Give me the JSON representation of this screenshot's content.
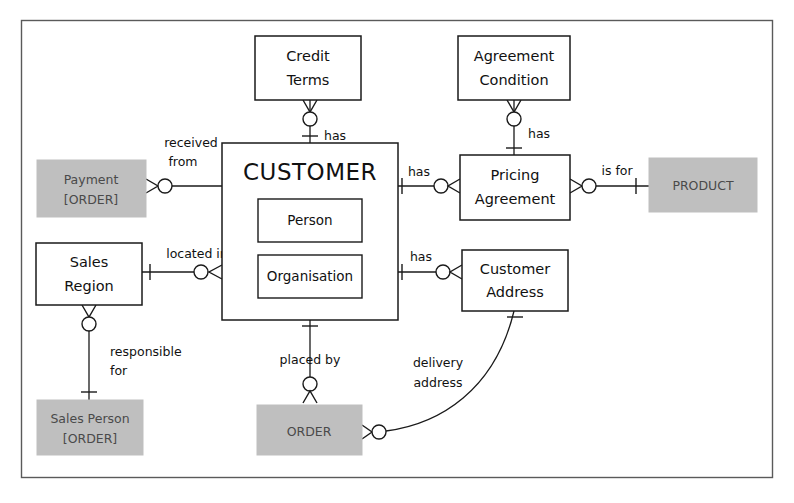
{
  "diagram": {
    "type": "entity-relationship",
    "notation": "crows-foot",
    "colors": {
      "shaded_entity_fill": "#bfbfbf",
      "plain_entity_fill": "#ffffff",
      "stroke": "#1a1a1a",
      "frame_stroke": "#5a5a5a",
      "background": "#ffffff"
    }
  },
  "entities": [
    {
      "id": "credit_terms",
      "label_lines": [
        "Credit",
        "Terms"
      ],
      "line1": "Credit",
      "line2": "Terms",
      "style": "plain",
      "x": 255,
      "y": 36,
      "w": 106,
      "h": 64
    },
    {
      "id": "agreement_condition",
      "label_lines": [
        "Agreement",
        "Condition"
      ],
      "line1": "Agreement",
      "line2": "Condition",
      "style": "plain",
      "x": 458,
      "y": 36,
      "w": 112,
      "h": 64
    },
    {
      "id": "payment_order",
      "label_lines": [
        "Payment",
        "[ORDER]"
      ],
      "line1": "Payment",
      "line2": "[ORDER]",
      "style": "shaded",
      "x": 37,
      "y": 160,
      "w": 109,
      "h": 57
    },
    {
      "id": "customer",
      "label_lines": [
        "CUSTOMER"
      ],
      "line1": "CUSTOMER",
      "style": "plain-large",
      "x": 222,
      "y": 143,
      "w": 176,
      "h": 177,
      "subtypes": [
        {
          "id": "person",
          "label": "Person",
          "x": 258,
          "y": 199,
          "w": 104,
          "h": 43
        },
        {
          "id": "organisation",
          "label": "Organisation",
          "x": 258,
          "y": 255,
          "w": 104,
          "h": 43
        }
      ]
    },
    {
      "id": "pricing_agreement",
      "label_lines": [
        "Pricing",
        "Agreement"
      ],
      "line1": "Pricing",
      "line2": "Agreement",
      "style": "plain",
      "x": 460,
      "y": 155,
      "w": 110,
      "h": 65
    },
    {
      "id": "product",
      "label_lines": [
        "PRODUCT"
      ],
      "line1": "PRODUCT",
      "style": "shaded",
      "x": 649,
      "y": 158,
      "w": 108,
      "h": 54
    },
    {
      "id": "sales_region",
      "label_lines": [
        "Sales",
        "Region"
      ],
      "line1": "Sales",
      "line2": "Region",
      "style": "plain",
      "x": 36,
      "y": 243,
      "w": 106,
      "h": 62
    },
    {
      "id": "customer_address",
      "label_lines": [
        "Customer",
        "Address"
      ],
      "line1": "Customer",
      "line2": "Address",
      "style": "plain",
      "x": 462,
      "y": 250,
      "w": 106,
      "h": 61
    },
    {
      "id": "sales_person_order",
      "label_lines": [
        "Sales Person",
        "[ORDER]"
      ],
      "line1": "Sales Person",
      "line2": "[ORDER]",
      "style": "shaded",
      "x": 37,
      "y": 400,
      "w": 106,
      "h": 55
    },
    {
      "id": "order",
      "label_lines": [
        "ORDER"
      ],
      "line1": "ORDER",
      "style": "shaded",
      "x": 257,
      "y": 405,
      "w": 105,
      "h": 50
    }
  ],
  "relationships": [
    {
      "id": "credit_terms_has",
      "label": "has",
      "label_lines": [
        "has"
      ],
      "from": "customer",
      "to": "credit_terms",
      "from_cardinality": "one",
      "to_cardinality": "zero-or-many"
    },
    {
      "id": "agreement_condition_has",
      "label": "has",
      "label_lines": [
        "has"
      ],
      "from": "pricing_agreement",
      "to": "agreement_condition",
      "from_cardinality": "one",
      "to_cardinality": "zero-or-many"
    },
    {
      "id": "payment_received_from",
      "label": "received from",
      "label_lines": [
        "received",
        "from"
      ],
      "from": "customer",
      "to": "payment_order",
      "from_cardinality": "one",
      "to_cardinality": "zero-or-many"
    },
    {
      "id": "pricing_agreement_has",
      "label": "has",
      "label_lines": [
        "has"
      ],
      "from": "customer",
      "to": "pricing_agreement",
      "from_cardinality": "one",
      "to_cardinality": "zero-or-many"
    },
    {
      "id": "product_is_for",
      "label": "is for",
      "label_lines": [
        "is for"
      ],
      "from": "pricing_agreement",
      "to": "product",
      "from_cardinality": "zero-or-many",
      "to_cardinality": "one"
    },
    {
      "id": "sales_region_located_in",
      "label": "located in",
      "label_lines": [
        "located in"
      ],
      "from": "sales_region",
      "to": "customer",
      "from_cardinality": "one",
      "to_cardinality": "zero-or-many"
    },
    {
      "id": "customer_address_has",
      "label": "has",
      "label_lines": [
        "has"
      ],
      "from": "customer",
      "to": "customer_address",
      "from_cardinality": "one",
      "to_cardinality": "zero-or-many"
    },
    {
      "id": "sales_person_responsible_for",
      "label": "responsible for",
      "label_lines": [
        "responsible",
        "for"
      ],
      "from": "sales_region",
      "to": "sales_person_order",
      "from_cardinality": "zero-or-many",
      "to_cardinality": "one"
    },
    {
      "id": "order_placed_by",
      "label": "placed by",
      "label_lines": [
        "placed by"
      ],
      "from": "customer",
      "to": "order",
      "from_cardinality": "one",
      "to_cardinality": "zero-or-many"
    },
    {
      "id": "order_delivery_address",
      "label": "delivery address",
      "label_lines": [
        "delivery",
        "address"
      ],
      "from": "customer_address",
      "to": "order",
      "from_cardinality": "one",
      "to_cardinality": "zero-or-many"
    }
  ],
  "labels": {
    "has_credit_terms": "has",
    "has_agreement_condition": "has",
    "received_from_1": "received",
    "received_from_2": "from",
    "has_pricing_agreement": "has",
    "is_for": "is for",
    "located_in": "located in",
    "has_customer_address": "has",
    "responsible_for_1": "responsible",
    "responsible_for_2": "for",
    "placed_by": "placed by",
    "delivery_address_1": "delivery",
    "delivery_address_2": "address"
  }
}
